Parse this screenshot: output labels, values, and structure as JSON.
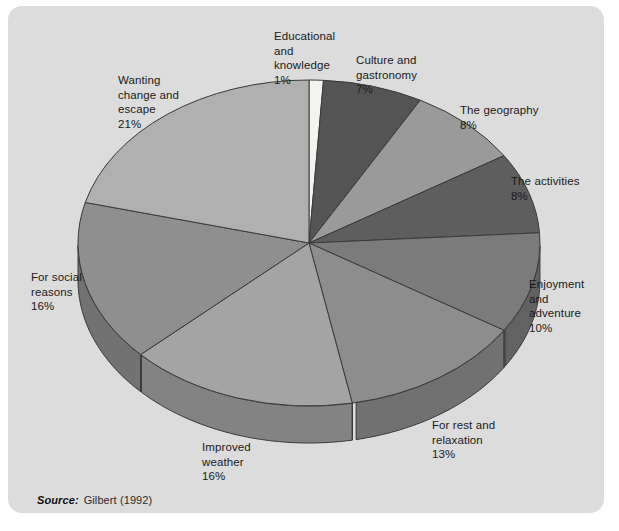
{
  "figure": {
    "panel_background": "#dcdcdc",
    "source_key": "Source:",
    "source_value": "Gilbert (1992)"
  },
  "chart_data": {
    "type": "pie",
    "title": "",
    "subtitle": "",
    "xlabel": "",
    "ylabel": "",
    "legend_position": "labels-around-pie",
    "grid": false,
    "three_d": true,
    "start_angle_deg": -90,
    "direction": "clockwise",
    "total_percent": 100,
    "categories": [
      "Educational and knowledge",
      "Culture and gastronomy",
      "The geography",
      "The activities",
      "Enjoyment and adventure",
      "For rest and relaxation",
      "Improved weather",
      "For social reasons",
      "Wanting change and escape"
    ],
    "values": [
      1,
      7,
      8,
      8,
      10,
      13,
      16,
      16,
      21
    ],
    "value_labels": [
      "1%",
      "7%",
      "8%",
      "8%",
      "10%",
      "13%",
      "16%",
      "16%",
      "21%"
    ],
    "colors": [
      "#f4f3ef",
      "#545454",
      "#9a9a9a",
      "#5e5e5e",
      "#7b7b7b",
      "#8d8d8d",
      "#a4a4a4",
      "#8f8f8f",
      "#b0b0b0"
    ],
    "slices": [
      {
        "label": "Educational\nand\nknowledge",
        "value": 1,
        "value_label": "1%",
        "color": "#f4f3ef",
        "label_text": "Educational\nand\nknowledge\n1%"
      },
      {
        "label": "Culture and\ngastronomy",
        "value": 7,
        "value_label": "7%",
        "color": "#545454",
        "label_text": "Culture and\ngastronomy\n7%"
      },
      {
        "label": "The geography",
        "value": 8,
        "value_label": "8%",
        "color": "#9a9a9a",
        "label_text": "The geography\n8%"
      },
      {
        "label": "The activities",
        "value": 8,
        "value_label": "8%",
        "color": "#5e5e5e",
        "label_text": "The activities\n8%"
      },
      {
        "label": "Enjoyment\nand\nadventure",
        "value": 10,
        "value_label": "10%",
        "color": "#7b7b7b",
        "label_text": "Enjoyment\nand\nadventure\n10%"
      },
      {
        "label": "For rest and\nrelaxation",
        "value": 13,
        "value_label": "13%",
        "color": "#8d8d8d",
        "label_text": "For rest and\nrelaxation\n13%"
      },
      {
        "label": "Improved\nweather",
        "value": 16,
        "value_label": "16%",
        "color": "#a4a4a4",
        "label_text": "Improved\nweather\n16%"
      },
      {
        "label": "For social\nreasons",
        "value": 16,
        "value_label": "16%",
        "color": "#8f8f8f",
        "label_text": "For social\nreasons\n16%"
      },
      {
        "label": "Wanting\nchange and\nescape",
        "value": 21,
        "value_label": "21%",
        "color": "#b0b0b0",
        "label_text": "Wanting\nchange and\nescape\n21%"
      }
    ]
  }
}
